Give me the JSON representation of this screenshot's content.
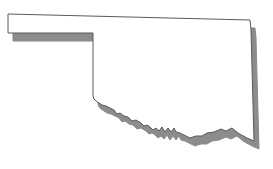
{
  "image": {
    "subject": "Oklahoma state outline",
    "alt": "Outline map of Oklahoma with drop shadow",
    "background_color": "#ffffff",
    "fill_color": "#ffffff",
    "stroke_color": "#5a5a5a",
    "shadow_color": "#8c8c8c",
    "shadow_offset": [
      5,
      8
    ]
  }
}
